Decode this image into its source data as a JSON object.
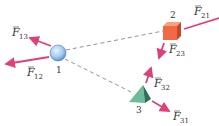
{
  "diagram": {
    "objects": [
      {
        "id": "1",
        "label": "1",
        "shape": "sphere"
      },
      {
        "id": "2",
        "label": "2",
        "shape": "cube"
      },
      {
        "id": "3",
        "label": "3",
        "shape": "pyramid"
      }
    ],
    "forces": [
      {
        "symbol": "F",
        "sub": "13"
      },
      {
        "symbol": "F",
        "sub": "12"
      },
      {
        "symbol": "F",
        "sub": "21"
      },
      {
        "symbol": "F",
        "sub": "23"
      },
      {
        "symbol": "F",
        "sub": "32"
      },
      {
        "symbol": "F",
        "sub": "31"
      }
    ],
    "colors": {
      "arrow": "#e0407a",
      "sphere": "#a8cdf0",
      "cube": "#f06a45",
      "pyramid": "#4e9e80",
      "dashed": "#777777"
    }
  }
}
